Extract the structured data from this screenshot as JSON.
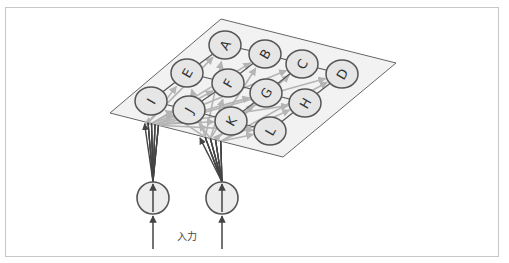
{
  "diagram": {
    "title": "",
    "input_label": "入力",
    "colors": {
      "frame": "#c8c8c8",
      "plane_fill": "#f2f2f2",
      "plane_stroke": "#666666",
      "node_fill": "#e6e6e6",
      "node_stroke": "#555555",
      "dark_line": "#444444",
      "light_arrow": "#b4b4b4"
    },
    "output_nodes": [
      {
        "id": "A",
        "x": 225,
        "y": 45
      },
      {
        "id": "B",
        "x": 265,
        "y": 54
      },
      {
        "id": "C",
        "x": 302,
        "y": 64
      },
      {
        "id": "D",
        "x": 342,
        "y": 74
      },
      {
        "id": "E",
        "x": 187,
        "y": 73
      },
      {
        "id": "F",
        "x": 228,
        "y": 83
      },
      {
        "id": "G",
        "x": 266,
        "y": 93
      },
      {
        "id": "H",
        "x": 305,
        "y": 103
      },
      {
        "id": "I",
        "x": 151,
        "y": 101
      },
      {
        "id": "J",
        "x": 189,
        "y": 110
      },
      {
        "id": "K",
        "x": 231,
        "y": 121
      },
      {
        "id": "L",
        "x": 270,
        "y": 131
      }
    ],
    "input_nodes": [
      {
        "id": "in1",
        "x": 153,
        "y": 198
      },
      {
        "id": "in2",
        "x": 222,
        "y": 198
      }
    ],
    "plane": {
      "top": [
        221,
        19
      ],
      "right": [
        396,
        63
      ],
      "bottom": [
        283,
        157
      ],
      "left": [
        110,
        113
      ]
    }
  }
}
